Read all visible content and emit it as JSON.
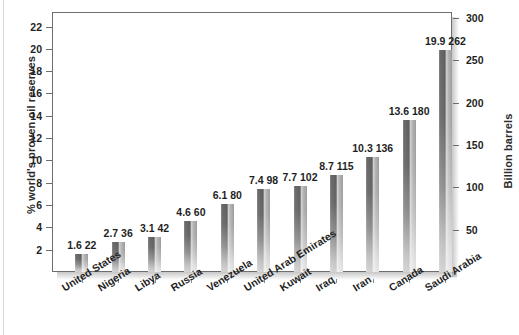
{
  "chart_data": {
    "type": "bar",
    "title": "",
    "subtitle": "",
    "ylabel": "% world's proven oil reserves",
    "y2label": "Billion barrels",
    "xlabel": "",
    "ylim": [
      0,
      23.3
    ],
    "y2lim": [
      0,
      307
    ],
    "grid": false,
    "legend": null,
    "categories": [
      "United States",
      "Nigeria",
      "Libya",
      "Russia",
      "Venezuela",
      "United Arab Emirates",
      "Kuwait",
      "Iraq",
      "Iran",
      "Canada",
      "Saudi Arabia"
    ],
    "series": [
      {
        "name": "% world's proven oil reserves",
        "axis": "left",
        "values": [
          1.6,
          2.7,
          3.1,
          4.6,
          6.1,
          7.4,
          7.7,
          8.7,
          10.3,
          13.6,
          19.9
        ]
      },
      {
        "name": "Billion barrels",
        "axis": "right",
        "values": [
          22,
          36,
          42,
          60,
          80,
          98,
          102,
          115,
          136,
          180,
          262
        ]
      }
    ],
    "bar_labels": [
      "1.6  22",
      "2.7  36",
      "3.1  42",
      "4.6  60",
      "6.1  80",
      "7.4  98",
      "7.7  102",
      "8.7  115",
      "10.3  136",
      "13.6  180",
      "19.9  262"
    ],
    "yticks_left": [
      "2",
      "4",
      "6",
      "8",
      "10",
      "12",
      "14",
      "16",
      "18",
      "20",
      "22"
    ],
    "yticks_right": [
      "50",
      "100",
      "150",
      "200",
      "250",
      "300"
    ],
    "colors": {
      "bar_dark": "#5e5e5e",
      "bar_light": "#cfcfcf",
      "axis": "#6e6e6e",
      "text": "#1f1f1f",
      "background": "#ffffff"
    }
  }
}
